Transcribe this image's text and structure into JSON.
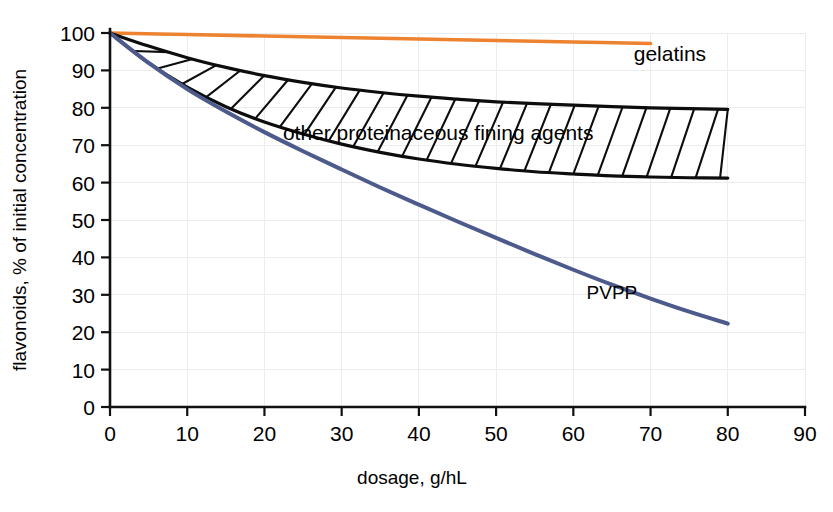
{
  "chart_data": {
    "type": "line",
    "title": "",
    "xlabel": "dosage, g/hL",
    "ylabel": "flavonoids, % of initial concentration",
    "xlim": [
      0,
      90
    ],
    "ylim": [
      0,
      100
    ],
    "xticks": [
      0,
      10,
      20,
      30,
      40,
      50,
      60,
      70,
      80,
      90
    ],
    "yticks": [
      0,
      10,
      20,
      30,
      40,
      50,
      60,
      70,
      80,
      90,
      100
    ],
    "xtick_labels": [
      "0",
      "10",
      "20",
      "30",
      "40",
      "50",
      "60",
      "70",
      "80",
      "90"
    ],
    "ytick_labels": [
      "0",
      "10",
      "20",
      "30",
      "40",
      "50",
      "60",
      "70",
      "80",
      "90",
      "100"
    ],
    "grid": true,
    "legend_position": "inline-annotations",
    "series": [
      {
        "name": "gelatins",
        "color": "#ed8230",
        "label_text": "gelatins",
        "x": [
          0,
          10,
          20,
          30,
          40,
          50,
          60,
          70
        ],
        "values": [
          100,
          99.6,
          99.2,
          98.8,
          98.4,
          98.0,
          97.6,
          97.2
        ]
      },
      {
        "name": "other proteinaceous fining agents upper bound",
        "color": "#0d0d0d",
        "label_text": "other proteinaceous fining agents",
        "x": [
          0,
          5,
          10,
          15,
          20,
          25,
          30,
          35,
          40,
          45,
          50,
          55,
          60,
          65,
          70,
          75,
          80
        ],
        "values": [
          100,
          96.5,
          93.4,
          90.8,
          88.6,
          86.8,
          85.3,
          84.1,
          83.1,
          82.3,
          81.6,
          81.1,
          80.7,
          80.3,
          80.0,
          79.8,
          79.6
        ]
      },
      {
        "name": "other proteinaceous fining agents lower bound",
        "color": "#0d0d0d",
        "label_text": "",
        "x": [
          0,
          5,
          10,
          15,
          20,
          25,
          30,
          35,
          40,
          45,
          50,
          55,
          60,
          65,
          70,
          75,
          80
        ],
        "values": [
          100,
          92.0,
          85.5,
          80.3,
          76.2,
          73.0,
          70.3,
          68.1,
          66.3,
          64.9,
          63.8,
          62.9,
          62.3,
          61.8,
          61.5,
          61.3,
          61.2
        ]
      },
      {
        "name": "PVPP",
        "color": "#4d5a8c",
        "label_text": "PVPP",
        "x": [
          0,
          5,
          10,
          15,
          20,
          25,
          30,
          35,
          40,
          45,
          50,
          55,
          60,
          65,
          70,
          75,
          80
        ],
        "values": [
          100,
          92.0,
          85.0,
          79.0,
          73.5,
          68.4,
          63.5,
          58.7,
          54.1,
          49.6,
          45.2,
          40.9,
          36.7,
          32.7,
          29.0,
          25.5,
          22.3
        ]
      }
    ],
    "annotations": [
      {
        "text": "gelatins",
        "x": 72.5,
        "y": 92.5
      },
      {
        "text": "other proteinaceous fining agents",
        "x": 42.5,
        "y": 71.5
      },
      {
        "text": "PVPP",
        "x": 65.0,
        "y": 29.0
      }
    ]
  },
  "style": {
    "gelatins_color": "#ed8230",
    "pvpp_color": "#4d5a8c",
    "band_edge_color": "#0d0d0d",
    "grid_color": "#ececed",
    "axis_color": "#111111",
    "background": "#ffffff"
  }
}
